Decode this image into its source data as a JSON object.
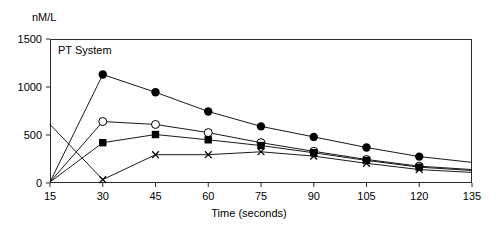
{
  "labels": {
    "unit": "nM/L",
    "panel_title": "PT System",
    "xaxis_title": "Time (seconds)"
  },
  "chart_data": {
    "type": "line",
    "title": "PT System",
    "xlabel": "Time (seconds)",
    "ylabel": "nM/L",
    "xlim": [
      15,
      135
    ],
    "ylim": [
      0,
      1500
    ],
    "xticks": [
      15,
      30,
      45,
      60,
      75,
      90,
      105,
      120,
      135
    ],
    "yticks": [
      0,
      500,
      1000,
      1500
    ],
    "grid": false,
    "legend": "none",
    "x": [
      15,
      30,
      45,
      60,
      75,
      90,
      105,
      120,
      135
    ],
    "series": [
      {
        "name": "series-filled-circle",
        "marker": "filled-circle",
        "color": "#000000",
        "x": [
          15,
          30,
          45,
          60,
          75,
          90,
          105,
          120,
          135
        ],
        "values": [
          10,
          1130,
          945,
          745,
          590,
          480,
          370,
          275,
          215
        ],
        "marker_at_last_point": false
      },
      {
        "name": "series-open-circle",
        "marker": "open-circle",
        "color": "#000000",
        "x": [
          15,
          30,
          45,
          60,
          75,
          90,
          105,
          120,
          135
        ],
        "values": [
          10,
          640,
          610,
          525,
          420,
          330,
          245,
          175,
          140
        ],
        "marker_at_last_point": false
      },
      {
        "name": "series-filled-square",
        "marker": "filled-square",
        "color": "#000000",
        "x": [
          15,
          30,
          45,
          60,
          75,
          90,
          105,
          120,
          135
        ],
        "values": [
          10,
          420,
          505,
          450,
          390,
          315,
          235,
          165,
          130
        ],
        "marker_at_last_point": false
      },
      {
        "name": "series-cross",
        "marker": "cross",
        "color": "#000000",
        "x": [
          15,
          30,
          45,
          60,
          75,
          90,
          105,
          120,
          135
        ],
        "values": [
          610,
          35,
          295,
          295,
          325,
          280,
          205,
          140,
          110
        ],
        "marker_at_last_point": false
      }
    ]
  },
  "ticks": {
    "y": [
      "1500",
      "1000",
      "500",
      "0"
    ],
    "x": [
      "15",
      "30",
      "45",
      "60",
      "75",
      "90",
      "105",
      "120",
      "135"
    ]
  }
}
